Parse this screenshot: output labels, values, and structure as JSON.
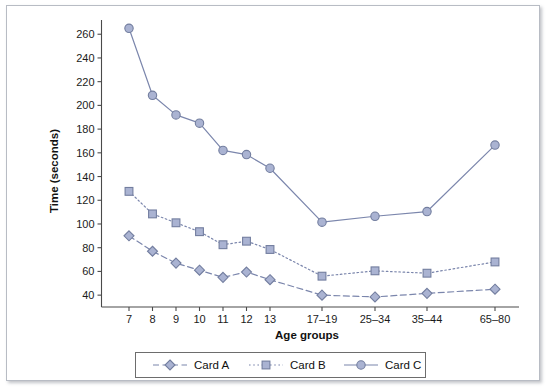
{
  "chart_data": {
    "type": "line",
    "title": "",
    "xlabel": "Age groups",
    "ylabel": "Time (seconds)",
    "categories": [
      "7",
      "8",
      "9",
      "10",
      "11",
      "12",
      "13",
      "17–19",
      "25–34",
      "35–44",
      "65–80"
    ],
    "x_positions": [
      122,
      145.5,
      169,
      192.5,
      216,
      239.5,
      263,
      315,
      368,
      420,
      488
    ],
    "ylim": [
      30,
      272
    ],
    "y_ticks": [
      40,
      60,
      80,
      100,
      120,
      140,
      160,
      180,
      200,
      220,
      240,
      260
    ],
    "grid": false,
    "legend_position": "below",
    "series": [
      {
        "name": "Card A",
        "marker": "diamond",
        "line_style": "dashed",
        "color": "#7b86ac",
        "fill": "#aab3d2",
        "values": [
          90,
          77,
          67,
          61,
          55,
          59.5,
          53,
          40,
          38.5,
          41.5,
          45
        ]
      },
      {
        "name": "Card B",
        "marker": "square",
        "line_style": "dotted",
        "color": "#7b86ac",
        "fill": "#aab3d2",
        "values": [
          127.5,
          108.5,
          101,
          93.5,
          82.5,
          85.5,
          78.5,
          56,
          60.5,
          58.5,
          68
        ]
      },
      {
        "name": "Card C",
        "marker": "circle",
        "line_style": "solid",
        "color": "#7b86ac",
        "fill": "#aab3d2",
        "values": [
          265,
          208.5,
          192,
          185,
          162,
          158.5,
          147,
          101.5,
          106.5,
          110.5,
          166.5
        ]
      }
    ]
  },
  "legend": {
    "entries": [
      {
        "label": "Card A",
        "marker": "diamond",
        "line_style": "dashed"
      },
      {
        "label": "Card B",
        "marker": "square",
        "line_style": "dotted"
      },
      {
        "label": "Card C",
        "marker": "circle",
        "line_style": "solid"
      }
    ]
  },
  "colors": {
    "marker_fill": "#aab3d2",
    "marker_stroke": "#737e9f",
    "line": "#7b86ac",
    "axis": "#4a4a4a",
    "text": "#111111",
    "frame": "#b8bcc4"
  }
}
